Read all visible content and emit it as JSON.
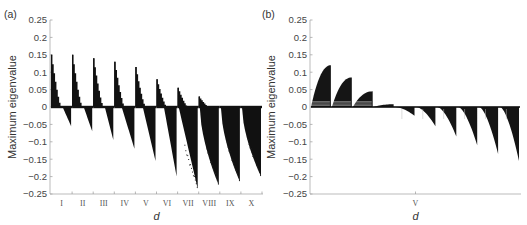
{
  "chart_data": [
    {
      "panel": "(a)",
      "type": "bar",
      "title": "",
      "xlabel": "d",
      "ylabel": "Maximum eigenvalue",
      "ylim": [
        -0.25,
        0.25
      ],
      "yticks": [
        0.25,
        0.2,
        0.15,
        0.1,
        0.05,
        0,
        -0.05,
        -0.1,
        -0.15,
        -0.2,
        -0.25
      ],
      "ytick_labels": [
        "0.25",
        "0.2",
        "0.15",
        "0.1",
        "0.05",
        "0",
        "−0.05",
        "−0.1",
        "−0.15",
        "−0.2",
        "−0.25"
      ],
      "categories": [
        "I",
        "II",
        "III",
        "IV",
        "V",
        "VI",
        "VII",
        "VIII",
        "IX",
        "X"
      ],
      "series": [
        {
          "name": "max positive eigenvalue",
          "values": [
            0.15,
            0.15,
            0.14,
            0.13,
            0.115,
            0.08,
            0.055,
            0.03,
            0.0,
            0.0
          ]
        },
        {
          "name": "min negative eigenvalue",
          "values": [
            -0.055,
            -0.07,
            -0.095,
            -0.12,
            -0.155,
            -0.2,
            -0.235,
            -0.225,
            -0.215,
            -0.2
          ]
        }
      ],
      "grid": false
    },
    {
      "panel": "(b)",
      "type": "bar",
      "title": "",
      "xlabel": "d",
      "ylabel": "Maximum eigenvalue",
      "ylim": [
        -0.25,
        0.25
      ],
      "yticks": [
        0.25,
        0.2,
        0.15,
        0.1,
        0.05,
        0,
        -0.05,
        -0.1,
        -0.15,
        -0.2,
        -0.25
      ],
      "ytick_labels": [
        "0.25",
        "0.2",
        "0.15",
        "0.1",
        "0.05",
        "0",
        "−0.05",
        "−0.1",
        "−0.15",
        "−0.2",
        "−0.25"
      ],
      "categories": [
        "V"
      ],
      "segments": [
        {
          "peak": 0.12
        },
        {
          "peak": 0.085
        },
        {
          "peak": 0.045
        },
        {
          "peak": 0.008
        },
        {
          "peak": -0.025
        },
        {
          "peak": -0.055
        },
        {
          "peak": -0.085
        },
        {
          "peak": -0.11
        },
        {
          "peak": -0.135
        },
        {
          "peak": -0.155
        }
      ],
      "grid": false
    }
  ]
}
